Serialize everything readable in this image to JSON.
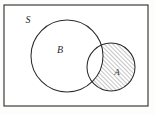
{
  "figure": {
    "type": "venn-diagram",
    "background_color": "#fdfdfc",
    "stroke_color": "#2b2b2b"
  },
  "universe": {
    "label": "S",
    "shape": "rectangle",
    "x": 4,
    "y": 5,
    "width": 144,
    "height": 101,
    "label_x": 28,
    "label_y": 23
  },
  "sets": [
    {
      "label": "B",
      "shape": "circle",
      "cx": 67,
      "cy": 56,
      "r": 36,
      "label_x": 60,
      "label_y": 53,
      "filled": false,
      "fill_color": "#ffffff"
    },
    {
      "label": "A",
      "shape": "circle",
      "cx": 111,
      "cy": 67,
      "r": 24,
      "label_x": 117,
      "label_y": 75,
      "filled": true,
      "fill_color": "#ffffff"
    }
  ],
  "shading": {
    "region": "A-minus-B",
    "pattern": "diagonal-hatch",
    "angle_degrees": 45,
    "spacing_px": 3,
    "line_color": "#3a3a3a",
    "line_width": 0.6
  },
  "labels": {
    "universe_label": "S",
    "set_b_label": "B",
    "set_a_label": "A"
  }
}
